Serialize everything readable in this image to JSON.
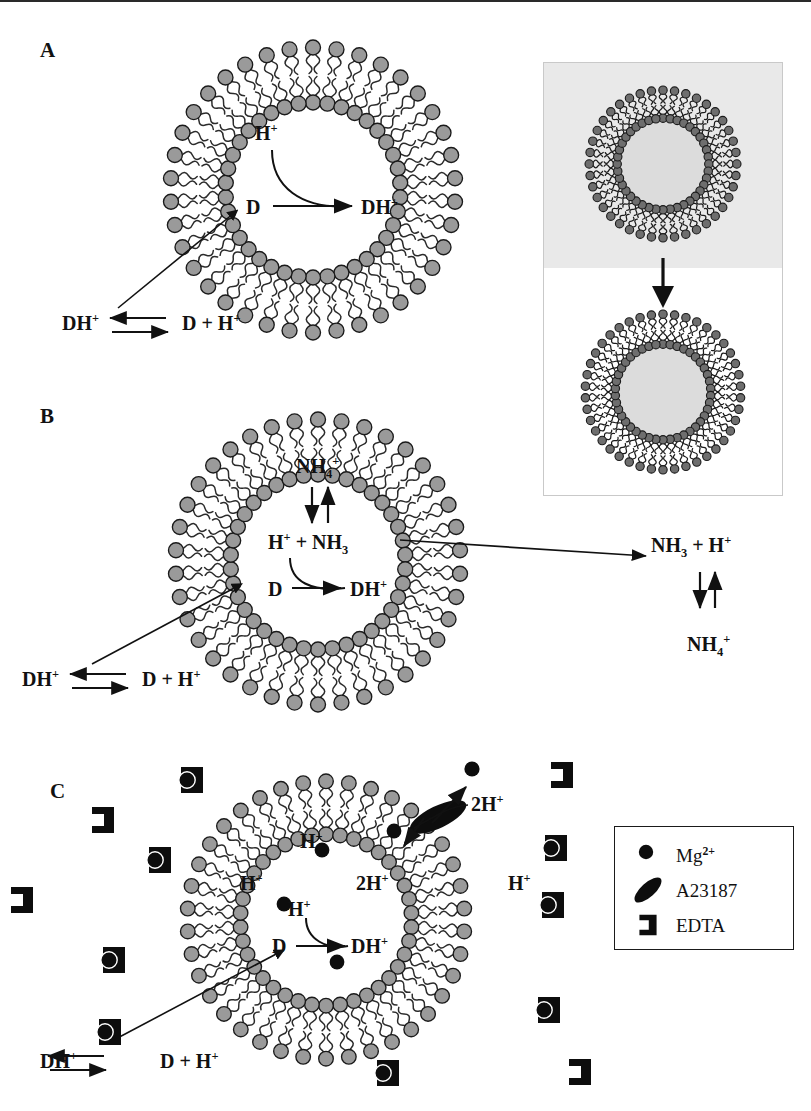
{
  "figure": {
    "panels": [
      {
        "id": "A",
        "label": "A",
        "mechanism": "pH gradient (proton) loading",
        "inner_labels": [
          {
            "name": "proton-label",
            "text": "H+",
            "html": "H<sup>+</sup>"
          },
          {
            "name": "drug-neutral-label",
            "text": "D",
            "html": "D"
          },
          {
            "name": "drug-protonated-label",
            "text": "DH+",
            "html": "DH<sup>+</sup>"
          }
        ],
        "equation": {
          "left": "DH+",
          "left_html": "DH<sup>+</sup>",
          "right": "D + H+",
          "right_html": "D + H<sup>+</sup>",
          "arrows": "equilibrium-double-arrow"
        }
      },
      {
        "id": "B",
        "label": "B",
        "mechanism": "Ammonium sulfate gradient loading",
        "inner_labels": [
          {
            "name": "ammonium-inside-label",
            "text": "NH4+",
            "html": "NH<sub>4</sub><sup>+</sup>"
          },
          {
            "name": "ammonia-proton-label",
            "text": "H+ + NH3",
            "html": "H<sup>+</sup> + NH<sub>3</sub>"
          },
          {
            "name": "drug-neutral-label",
            "text": "D",
            "html": "D"
          },
          {
            "name": "drug-protonated-label",
            "text": "DH+",
            "html": "DH<sup>+</sup>"
          }
        ],
        "outer_labels": [
          {
            "name": "ammonia-outside-label",
            "text": "NH3 + H+",
            "html": "NH<sub>3</sub> + H<sup>+</sup>"
          },
          {
            "name": "ammonium-outside-label",
            "text": "NH4+",
            "html": "NH<sub>4</sub><sup>+</sup>"
          }
        ],
        "equation": {
          "left": "DH+",
          "left_html": "DH<sup>+</sup>",
          "right": "D + H+",
          "right_html": "D + H<sup>+</sup>",
          "arrows": "equilibrium-double-arrow"
        }
      },
      {
        "id": "C",
        "label": "C",
        "mechanism": "A23187 ionophore / Mg2+ gradient loading",
        "inner_labels": [
          {
            "name": "proton-label-1",
            "text": "H+",
            "html": "H<sup>+</sup>"
          },
          {
            "name": "proton-label-2",
            "text": "H+",
            "html": "H<sup>+</sup>"
          },
          {
            "name": "proton-label-3",
            "text": "H+",
            "html": "H<sup>+</sup>"
          },
          {
            "name": "two-proton-label-inner",
            "text": "2H+",
            "html": "2H<sup>+</sup>"
          },
          {
            "name": "drug-neutral-label",
            "text": "D",
            "html": "D"
          },
          {
            "name": "drug-protonated-label",
            "text": "DH+",
            "html": "DH<sup>+</sup>"
          }
        ],
        "outer_labels": [
          {
            "name": "two-proton-label-outer",
            "text": "2H+",
            "html": "2H<sup>+</sup>"
          },
          {
            "name": "proton-label-outside",
            "text": "H+",
            "html": "H<sup>+</sup>"
          }
        ],
        "equation": {
          "left": "DH+",
          "left_html": "DH<sup>+</sup>",
          "right": "D + H+",
          "right_html": "D + H<sup>+</sup>",
          "arrows": "equilibrium-double-arrow"
        },
        "internal_mg_count": 4,
        "external_mg_edta_count": 8,
        "external_empty_edta_count": 4
      }
    ],
    "legend": {
      "name": "symbol-legend",
      "items": [
        {
          "symbol": "filled-circle",
          "label": "Mg2+",
          "label_html": "Mg<sup>2+</sup>"
        },
        {
          "symbol": "filled-ellipse",
          "label": "A23187",
          "label_html": "A23187"
        },
        {
          "symbol": "bracket-chelator",
          "label": "EDTA",
          "label_html": "EDTA"
        }
      ]
    },
    "inset": {
      "name": "liposome-transformation-inset",
      "description": "Two liposomes, upper on gray field, arrow pointing down to lower liposome on white field",
      "arrow": "downward-arrow"
    },
    "colors": {
      "lipid_head_fill": "#9a9a9a",
      "lipid_head_stroke": "#1a1a1a",
      "lipid_tail": "#2b2b2b",
      "ink": "#111111",
      "inset_gray": "#e9e9e9",
      "mg_fill": "#0d0d0d",
      "edta_fill": "#0d0d0d",
      "a23187_fill": "#0d0d0d",
      "legend_border": "#1a1a1a"
    }
  }
}
